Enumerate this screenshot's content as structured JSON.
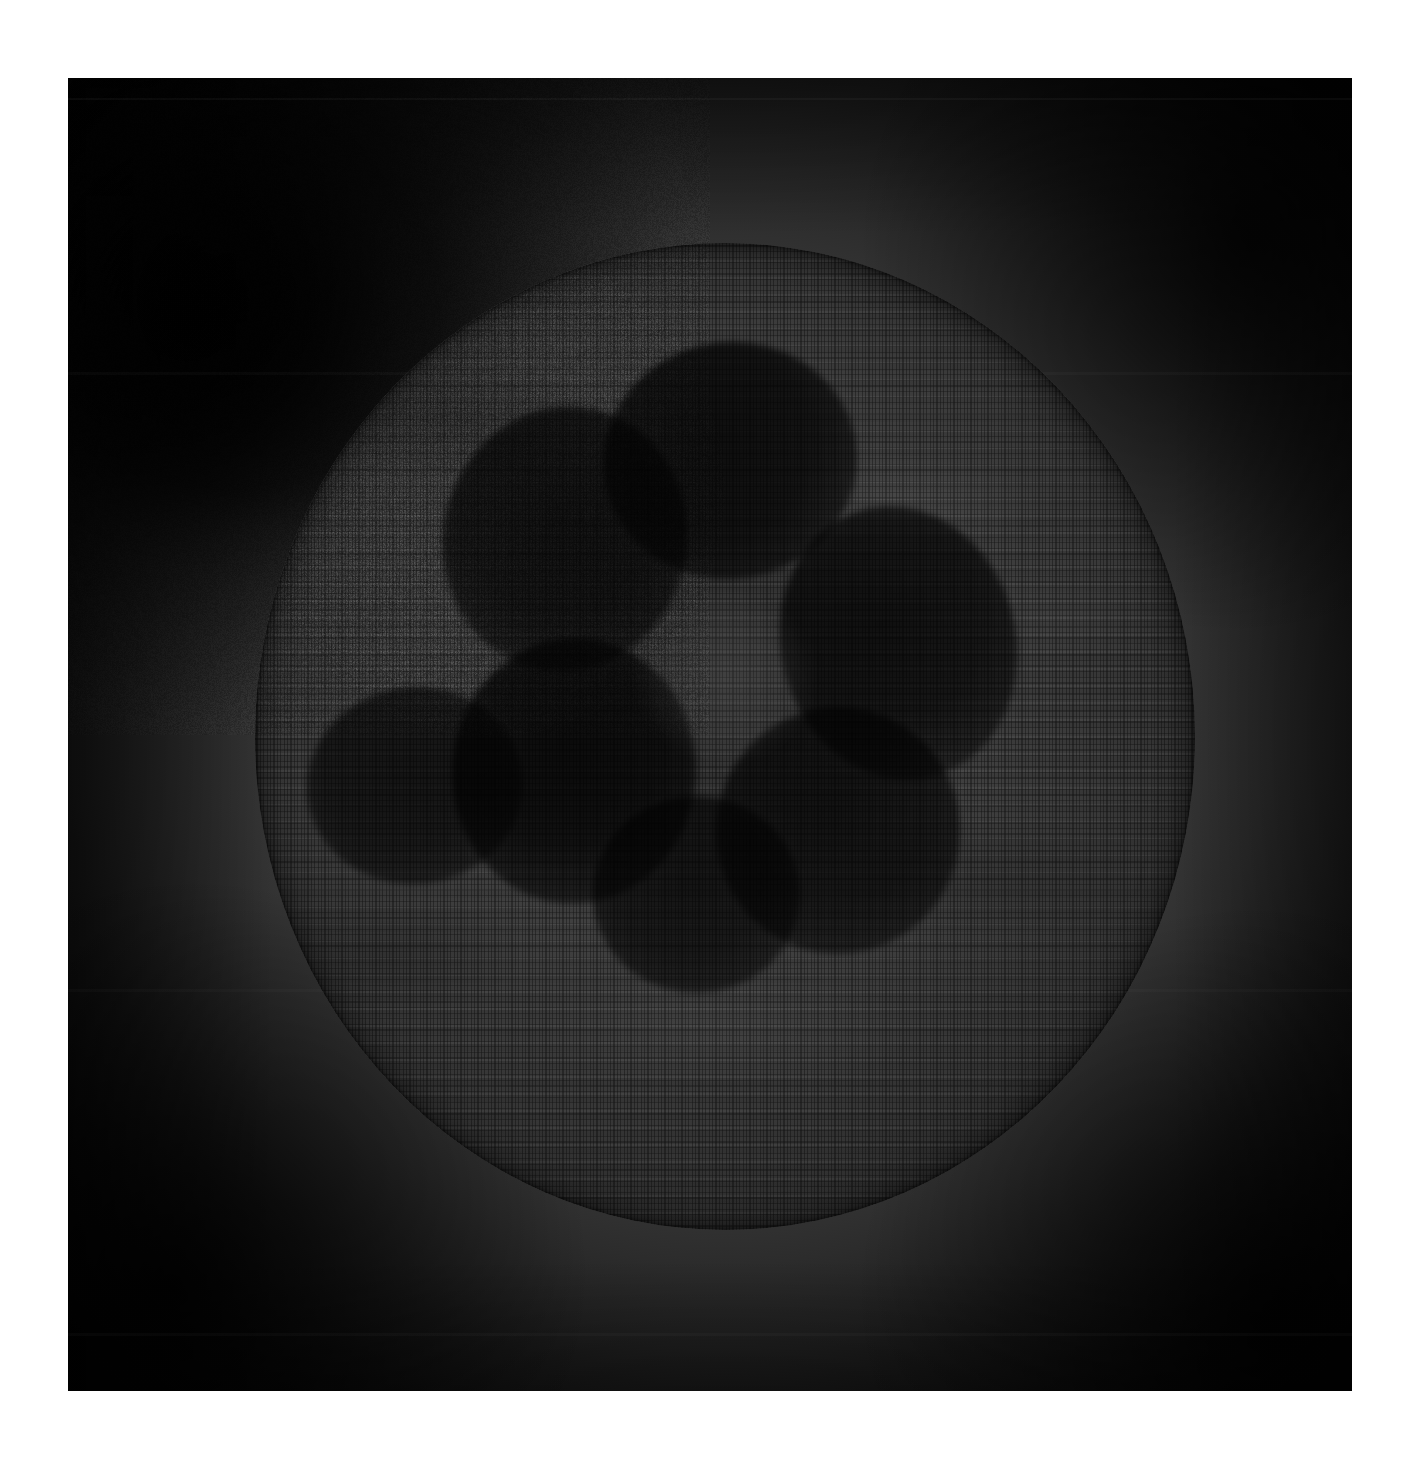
{
  "artwork": {
    "medium": "pen-and-ink drawing on toned paper",
    "subject": "textured dark sphere with clustered dark blobs",
    "orientation": "portrait",
    "canvas": {
      "width": 1420,
      "height": 1461,
      "background_color": "#ffffff"
    },
    "plate": {
      "x": 68,
      "y": 78,
      "width": 1284,
      "height": 1313,
      "base_color": "#1a1a1a",
      "halo_color": "#565656",
      "corner_color": "#040404",
      "notes": "scanned sheet with vignetted charcoal ground and faint horizontal scan seams"
    },
    "sphere": {
      "center_x": 725,
      "center_y": 736,
      "radius_x": 470,
      "radius_y": 493,
      "surface_color": "#4a4a4a",
      "rim_color": "#1f1f1f",
      "texture": "horizontal rows of short vertical pen strokes, woven appearance",
      "label": "sphere"
    },
    "blobs": [
      {
        "name": "blob-top",
        "cx": 50.5,
        "cy": 22.0,
        "rx": 13.5,
        "ry": 12.0,
        "rot": -8,
        "opacity": 0.94
      },
      {
        "name": "blob-upper-left",
        "cx": 33.0,
        "cy": 30.0,
        "rx": 13.0,
        "ry": 13.5,
        "rot": 12,
        "opacity": 0.9
      },
      {
        "name": "blob-right",
        "cx": 68.5,
        "cy": 40.5,
        "rx": 12.5,
        "ry": 14.0,
        "rot": -14,
        "opacity": 0.88
      },
      {
        "name": "blob-center-left",
        "cx": 34.0,
        "cy": 53.5,
        "rx": 13.0,
        "ry": 13.5,
        "rot": 4,
        "opacity": 0.95
      },
      {
        "name": "blob-far-left",
        "cx": 17.0,
        "cy": 55.0,
        "rx": 11.5,
        "ry": 10.0,
        "rot": -6,
        "opacity": 0.8
      },
      {
        "name": "blob-lower-right",
        "cx": 62.0,
        "cy": 59.5,
        "rx": 13.0,
        "ry": 12.5,
        "rot": 10,
        "opacity": 0.86
      },
      {
        "name": "blob-bottom",
        "cx": 47.0,
        "cy": 66.0,
        "rx": 11.0,
        "ry": 10.0,
        "rot": 0,
        "opacity": 0.82
      }
    ],
    "nucleus": {
      "cloud": {
        "cx": 47.0,
        "cy": 44.0,
        "rx": 30.0,
        "ry": 28.0
      },
      "core_light": {
        "cx": 50.0,
        "cy": 44.0,
        "rx": 9.0,
        "ry": 8.0
      }
    },
    "palette": {
      "paper_white": "#ffffff",
      "plate_dark": "#0a0a0a",
      "ground_mid": "#3a3a3a",
      "sphere_light": "#4e4e4e",
      "sphere_mid": "#3c3c3c",
      "sphere_dark": "#2a2a2a",
      "blob_ink": "#141414"
    }
  }
}
